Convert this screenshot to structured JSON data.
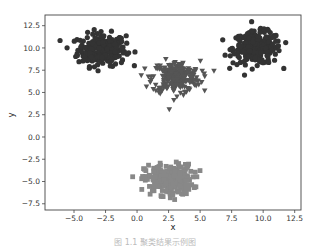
{
  "chart_data": {
    "type": "scatter",
    "title": "",
    "xlabel": "x",
    "ylabel": "y",
    "xlim": [
      -7.3,
      13.0
    ],
    "ylim": [
      -8.2,
      13.7
    ],
    "xticks": [
      -5.0,
      -2.5,
      0.0,
      2.5,
      5.0,
      7.5,
      10.0,
      12.5
    ],
    "xtick_labels": [
      "−5.0",
      "−2.5",
      "0.0",
      "2.5",
      "5.0",
      "7.5",
      "10.0",
      "12.5"
    ],
    "yticks": [
      -7.5,
      -5.0,
      -2.5,
      0.0,
      2.5,
      5.0,
      7.5,
      10.0,
      12.5
    ],
    "ytick_labels": [
      "−7.5",
      "−5.0",
      "−2.5",
      "0.0",
      "2.5",
      "5.0",
      "7.5",
      "10.0",
      "12.5"
    ],
    "grid": false,
    "legend": null,
    "series": [
      {
        "name": "cluster-1",
        "marker": "circle",
        "color": "#333333",
        "center": [
          -2.8,
          9.8
        ],
        "spread": [
          0.95,
          0.9
        ],
        "count": 250
      },
      {
        "name": "cluster-2",
        "marker": "circle",
        "color": "#333333",
        "center": [
          9.5,
          10.0
        ],
        "spread": [
          0.95,
          0.9
        ],
        "count": 250
      },
      {
        "name": "cluster-3",
        "marker": "triangle-down",
        "color": "#555555",
        "center": [
          3.1,
          6.7
        ],
        "spread": [
          0.95,
          0.9
        ],
        "count": 250
      },
      {
        "name": "cluster-4",
        "marker": "square",
        "color": "#888888",
        "center": [
          2.5,
          -4.8
        ],
        "spread": [
          0.95,
          0.85
        ],
        "count": 250
      }
    ],
    "caption": "图 1.1  聚类结果示例图"
  }
}
